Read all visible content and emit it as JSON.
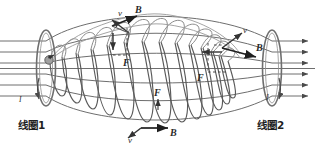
{
  "figure": {
    "background_color": "#ffffff",
    "line_color": "#6e6e6e",
    "dark_line_color": "#4a4a4a",
    "vector_color": "#262626",
    "label_color": "#2b2b2b"
  },
  "coils": {
    "left": {
      "name_label": "线圈1",
      "current_label": "I"
    },
    "right": {
      "name_label": "线圈2",
      "current_label": "I"
    }
  },
  "vectors": {
    "top_left_velocity": "v",
    "top_left_field": "B",
    "top_left_force": "F",
    "right_velocity": "v",
    "right_field": "B",
    "right_force": "F",
    "center_force": "F",
    "bottom_velocity": "v",
    "bottom_field": "B"
  },
  "elements": {
    "particle_marker": "charged-particle",
    "field_line_count": 7,
    "helix_turn_count": 13
  }
}
